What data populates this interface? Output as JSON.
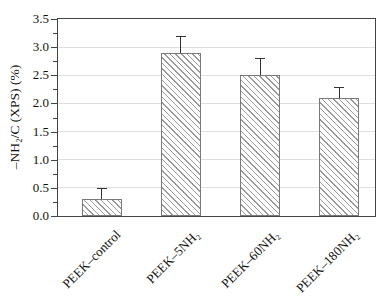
{
  "chart_data": {
    "type": "bar",
    "title": "",
    "xlabel": "",
    "ylabel": "–NH₂/C (XPS) (%)",
    "ylim": [
      0,
      3.5
    ],
    "ytick_labels": [
      "0.0",
      "0.5",
      "1.0",
      "1.5",
      "2.0",
      "2.5",
      "3.0",
      "3.5"
    ],
    "minor_tick_step": 0.25,
    "grid": "horizontal-major",
    "legend": "none",
    "categories": [
      "PEEK–control",
      "PEEK–5NH₂",
      "PEEK–60NH₂",
      "PEEK–180NH₂"
    ],
    "values": [
      0.3,
      2.9,
      2.5,
      2.1
    ],
    "errors_plus": [
      0.2,
      0.3,
      0.3,
      0.2
    ],
    "bar_hatch": "diagonal-backslash",
    "colors": {
      "bar_fill": "#ffffff",
      "bar_hatch_line": "#9a9a9a",
      "bar_edge": "#7a7a7a",
      "error_bar": "#333333",
      "axis": "#444444",
      "gridline": "#dedede",
      "text": "#111111",
      "background": "#ffffff"
    }
  }
}
